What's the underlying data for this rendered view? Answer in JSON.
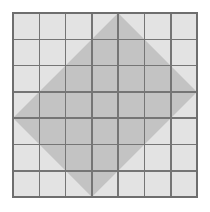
{
  "figure": {
    "canvas": {
      "width": 210,
      "height": 212,
      "background": "#ffffff"
    },
    "grid": {
      "name": "square-lattice",
      "columns": 7,
      "rows": 7,
      "x0": 13,
      "y0": 13,
      "x1": 197,
      "y1": 197,
      "cell_width": 26.29,
      "cell_height": 26.29,
      "cell_fill": "#e3e3e3",
      "line_color": "#757575",
      "line_width": 1.6,
      "border_color": "#6e6e6e",
      "border_width": 2.0,
      "x_lines": [
        13,
        39.3,
        65.6,
        91.9,
        118.1,
        144.4,
        170.7,
        197
      ],
      "y_lines": [
        13,
        39.3,
        65.6,
        91.9,
        118.1,
        144.4,
        170.7,
        197
      ]
    },
    "shape": {
      "name": "tilted-square",
      "type": "polygon",
      "fill": "#c3c3c3",
      "opacity": 1,
      "stroke": "none",
      "vertices": [
        {
          "label": "top",
          "x": 118.1,
          "y": 13
        },
        {
          "label": "right",
          "x": 197,
          "y": 91.9
        },
        {
          "label": "bottom",
          "x": 91.9,
          "y": 197
        },
        {
          "label": "left",
          "x": 13,
          "y": 118.1
        }
      ]
    }
  },
  "chart_data": {
    "type": "diagram",
    "grid_columns": 7,
    "grid_rows": 7,
    "polygon_vertices": [
      [
        118.1,
        13
      ],
      [
        197,
        91.9
      ],
      [
        91.9,
        197
      ],
      [
        13,
        118.1
      ]
    ],
    "shaded_region_color": "#c3c3c3",
    "grid_cell_color": "#e3e3e3",
    "grid_line_color": "#757575"
  }
}
